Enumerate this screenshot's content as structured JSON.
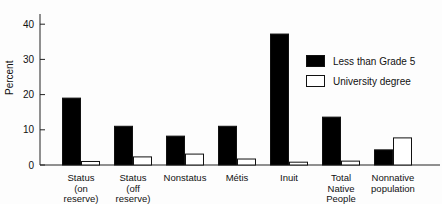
{
  "chart_data": {
    "type": "bar",
    "title": "",
    "xlabel": "",
    "ylabel": "Percent",
    "ylim": [
      0,
      44
    ],
    "yticks": [
      0,
      10,
      20,
      30,
      40
    ],
    "grid": false,
    "legend_position": "upper right",
    "categories": [
      "Status (on reserve)",
      "Status (off reserve)",
      "Nonstatus",
      "Métis",
      "Inuit",
      "Total Native People",
      "Nonnative population"
    ],
    "category_lines": [
      [
        "Status",
        "(on",
        "reserve)"
      ],
      [
        "Status",
        "(off",
        "reserve)"
      ],
      [
        "Nonstatus"
      ],
      [
        "Métis"
      ],
      [
        "Inuit"
      ],
      [
        "Total",
        "Native",
        "People"
      ],
      [
        "Nonnative",
        "population"
      ]
    ],
    "series": [
      {
        "name": "Less than Grade 5",
        "color": "#000000",
        "values": [
          19,
          11,
          8.2,
          11,
          37.2,
          13.6,
          4.3
        ]
      },
      {
        "name": "University degree",
        "color": "#ffffff",
        "values": [
          1.0,
          2.3,
          3.1,
          1.7,
          0.8,
          1.1,
          7.7
        ]
      }
    ]
  }
}
